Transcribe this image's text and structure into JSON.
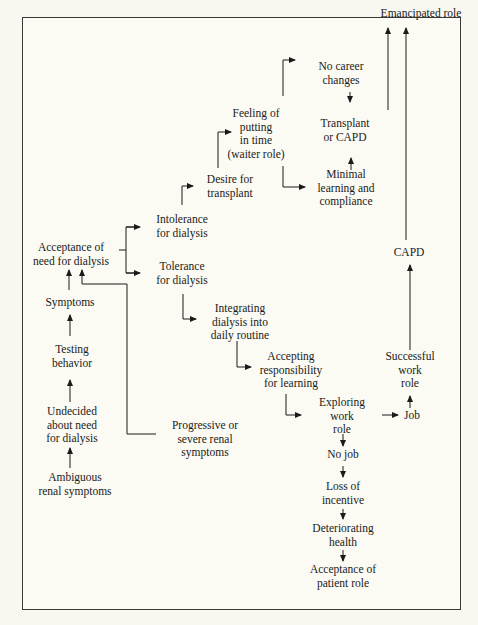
{
  "diagram": {
    "nodes": {
      "emancipated": [
        "Emancipated role"
      ],
      "no_career": [
        "No career",
        "changes"
      ],
      "feeling": [
        "Feeling of",
        "putting",
        "in time",
        "(waiter role)"
      ],
      "transplant_capd": [
        "Transplant",
        "or CAPD"
      ],
      "desire": [
        "Desire for",
        "transplant"
      ],
      "minimal": [
        "Minimal",
        "learning and",
        "compliance"
      ],
      "intolerance": [
        "Intolerance",
        "for dialysis"
      ],
      "acceptance_need": [
        "Acceptance of",
        "need for dialysis"
      ],
      "tolerance": [
        "Tolerance",
        "for dialysis"
      ],
      "capd": [
        "CAPD"
      ],
      "symptoms": [
        "Symptoms"
      ],
      "integrating": [
        "Integrating",
        "dialysis into",
        "daily routine"
      ],
      "testing": [
        "Testing",
        "behavior"
      ],
      "accepting_resp": [
        "Accepting",
        "responsibility",
        "for learning"
      ],
      "successful": [
        "Successful",
        "work",
        "role"
      ],
      "exploring": [
        "Exploring",
        "work",
        "role"
      ],
      "job": [
        "Job"
      ],
      "undecided": [
        "Undecided",
        "about need",
        "for dialysis"
      ],
      "progressive": [
        "Progressive or",
        "severe renal",
        "symptoms"
      ],
      "no_job": [
        "No job"
      ],
      "ambiguous": [
        "Ambiguous",
        "renal symptoms"
      ],
      "loss": [
        "Loss of",
        "incentive"
      ],
      "deteriorating": [
        "Deteriorating",
        "health"
      ],
      "acceptance_patient": [
        "Acceptance of",
        "patient role"
      ]
    },
    "edges": [
      [
        "ambiguous",
        "undecided"
      ],
      [
        "undecided",
        "testing"
      ],
      [
        "testing",
        "symptoms"
      ],
      [
        "symptoms",
        "acceptance_need"
      ],
      [
        "progressive",
        "acceptance_need"
      ],
      [
        "acceptance_need",
        "intolerance"
      ],
      [
        "acceptance_need",
        "tolerance"
      ],
      [
        "intolerance",
        "desire"
      ],
      [
        "desire",
        "feeling"
      ],
      [
        "feeling",
        "no_career"
      ],
      [
        "feeling",
        "minimal"
      ],
      [
        "no_career",
        "transplant_capd"
      ],
      [
        "minimal",
        "transplant_capd"
      ],
      [
        "transplant_capd",
        "emancipated"
      ],
      [
        "tolerance",
        "integrating"
      ],
      [
        "integrating",
        "accepting_resp"
      ],
      [
        "accepting_resp",
        "exploring"
      ],
      [
        "exploring",
        "job"
      ],
      [
        "job",
        "successful"
      ],
      [
        "successful",
        "capd"
      ],
      [
        "capd",
        "emancipated"
      ],
      [
        "exploring",
        "no_job"
      ],
      [
        "no_job",
        "loss"
      ],
      [
        "loss",
        "deteriorating"
      ],
      [
        "deteriorating",
        "acceptance_patient"
      ]
    ]
  }
}
